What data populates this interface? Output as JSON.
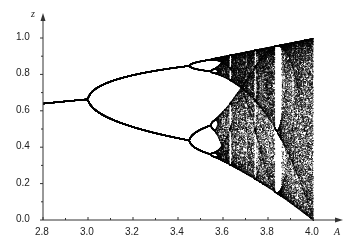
{
  "chart_data": {
    "type": "scatter",
    "title": "",
    "subtitle": "Bifurcation diagram of the logistic map z_{n+1} = A z_n (1 - z_n)",
    "xlabel": "A",
    "ylabel": "z",
    "xlim": [
      2.8,
      4.0
    ],
    "ylim": [
      0.0,
      1.0
    ],
    "grid": false,
    "legend": null,
    "x_ticks": [
      "2.8",
      "3.0",
      "3.2",
      "3.4",
      "3.6",
      "3.8",
      "4.0"
    ],
    "y_ticks": [
      "0.0",
      "0.2",
      "0.4",
      "0.6",
      "0.8",
      "1.0"
    ],
    "minor_ticks": true,
    "annotations": [],
    "features": {
      "fixed_point_start": {
        "A": 2.8,
        "z": 0.643
      },
      "period_2_bifurcation": {
        "A": 3.0,
        "z": 0.667
      },
      "period_4_bifurcation": {
        "A": 3.449,
        "z_upper": 0.852,
        "z_lower": 0.44
      },
      "onset_of_chaos": {
        "A": 3.57
      },
      "period_3_window": {
        "A_start": 3.828,
        "A_end": 3.857
      },
      "chaos_band_end": {
        "A": 4.0,
        "z_min": 0.0,
        "z_max": 1.0
      }
    },
    "sample_points": [
      {
        "A": 2.8,
        "z": [
          0.643
        ]
      },
      {
        "A": 2.9,
        "z": [
          0.655
        ]
      },
      {
        "A": 3.0,
        "z": [
          0.667
        ]
      },
      {
        "A": 3.2,
        "z": [
          0.513,
          0.799
        ]
      },
      {
        "A": 3.4,
        "z": [
          0.452,
          0.842
        ]
      },
      {
        "A": 3.5,
        "z": [
          0.383,
          0.501,
          0.827,
          0.875
        ]
      },
      {
        "A": 3.83,
        "z": [
          0.156,
          0.505,
          0.957
        ]
      },
      {
        "A": 4.0,
        "z_range": [
          0.0,
          1.0
        ]
      }
    ],
    "point_color": "#000000"
  },
  "render": {
    "iterations_transient": 300,
    "iterations_plot_chaos": 90,
    "iterations_plot_periodic": 64,
    "A_steps": 900
  }
}
